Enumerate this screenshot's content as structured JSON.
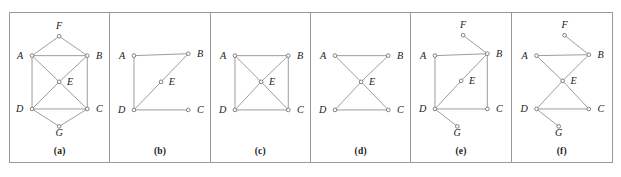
{
  "figure": {
    "title": "",
    "background": "#ffffff",
    "border_color": "#9a9a9a",
    "edge_color": "#8e8e8e",
    "node_stroke": "#6f6f6f",
    "node_fill": "#ffffff",
    "label_color": "#1a1a1a"
  },
  "panels": [
    {
      "caption": "(a)",
      "vertices": [
        {
          "id": "A",
          "label": "A",
          "x": 22,
          "y": 44,
          "lx": 13,
          "ly": 47,
          "anchor": "end"
        },
        {
          "id": "B",
          "label": "B",
          "x": 79,
          "y": 44,
          "lx": 88,
          "ly": 47,
          "anchor": "start"
        },
        {
          "id": "C",
          "label": "C",
          "x": 79,
          "y": 99,
          "lx": 88,
          "ly": 102,
          "anchor": "start"
        },
        {
          "id": "D",
          "label": "D",
          "x": 22,
          "y": 99,
          "lx": 13,
          "ly": 102,
          "anchor": "end"
        },
        {
          "id": "E",
          "label": "E",
          "x": 50,
          "y": 71,
          "lx": 58,
          "ly": 74,
          "anchor": "start"
        },
        {
          "id": "F",
          "label": "F",
          "x": 50,
          "y": 24,
          "lx": 50,
          "ly": 16,
          "anchor": "middle"
        },
        {
          "id": "G",
          "label": "G",
          "x": 50,
          "y": 117,
          "lx": 50,
          "ly": 127,
          "anchor": "middle"
        }
      ],
      "edges": [
        [
          "A",
          "B"
        ],
        [
          "A",
          "D"
        ],
        [
          "A",
          "E"
        ],
        [
          "A",
          "F"
        ],
        [
          "B",
          "C"
        ],
        [
          "B",
          "E"
        ],
        [
          "B",
          "F"
        ],
        [
          "C",
          "D"
        ],
        [
          "C",
          "E"
        ],
        [
          "C",
          "G"
        ],
        [
          "D",
          "E"
        ],
        [
          "D",
          "G"
        ]
      ]
    },
    {
      "caption": "(b)",
      "vertices": [
        {
          "id": "A",
          "label": "A",
          "x": 24,
          "y": 44,
          "lx": 15,
          "ly": 47,
          "anchor": "end"
        },
        {
          "id": "B",
          "label": "B",
          "x": 80,
          "y": 42,
          "lx": 89,
          "ly": 45,
          "anchor": "start"
        },
        {
          "id": "C",
          "label": "C",
          "x": 80,
          "y": 100,
          "lx": 89,
          "ly": 103,
          "anchor": "start"
        },
        {
          "id": "D",
          "label": "D",
          "x": 24,
          "y": 100,
          "lx": 15,
          "ly": 103,
          "anchor": "end"
        },
        {
          "id": "E",
          "label": "E",
          "x": 52,
          "y": 71,
          "lx": 60,
          "ly": 74,
          "anchor": "start"
        }
      ],
      "edges": [
        [
          "A",
          "B"
        ],
        [
          "A",
          "D"
        ],
        [
          "D",
          "C"
        ],
        [
          "D",
          "E"
        ],
        [
          "E",
          "B"
        ]
      ]
    },
    {
      "caption": "(c)",
      "vertices": [
        {
          "id": "A",
          "label": "A",
          "x": 24,
          "y": 44,
          "lx": 15,
          "ly": 47,
          "anchor": "end"
        },
        {
          "id": "B",
          "label": "B",
          "x": 79,
          "y": 44,
          "lx": 88,
          "ly": 47,
          "anchor": "start"
        },
        {
          "id": "C",
          "label": "C",
          "x": 79,
          "y": 100,
          "lx": 88,
          "ly": 103,
          "anchor": "start"
        },
        {
          "id": "D",
          "label": "D",
          "x": 24,
          "y": 100,
          "lx": 15,
          "ly": 103,
          "anchor": "end"
        },
        {
          "id": "E",
          "label": "E",
          "x": 51,
          "y": 71,
          "lx": 59,
          "ly": 74,
          "anchor": "start"
        }
      ],
      "edges": [
        [
          "A",
          "B"
        ],
        [
          "A",
          "D"
        ],
        [
          "D",
          "C"
        ],
        [
          "B",
          "C"
        ],
        [
          "A",
          "E"
        ],
        [
          "B",
          "E"
        ],
        [
          "C",
          "E"
        ],
        [
          "D",
          "E"
        ]
      ]
    },
    {
      "caption": "(d)",
      "vertices": [
        {
          "id": "A",
          "label": "A",
          "x": 24,
          "y": 44,
          "lx": 15,
          "ly": 47,
          "anchor": "end"
        },
        {
          "id": "B",
          "label": "B",
          "x": 79,
          "y": 44,
          "lx": 88,
          "ly": 47,
          "anchor": "start"
        },
        {
          "id": "C",
          "label": "C",
          "x": 79,
          "y": 100,
          "lx": 88,
          "ly": 103,
          "anchor": "start"
        },
        {
          "id": "D",
          "label": "D",
          "x": 24,
          "y": 100,
          "lx": 15,
          "ly": 103,
          "anchor": "end"
        },
        {
          "id": "E",
          "label": "E",
          "x": 51,
          "y": 71,
          "lx": 59,
          "ly": 74,
          "anchor": "start"
        }
      ],
      "edges": [
        [
          "A",
          "B"
        ],
        [
          "D",
          "C"
        ],
        [
          "A",
          "E"
        ],
        [
          "E",
          "C"
        ],
        [
          "B",
          "E"
        ],
        [
          "E",
          "D"
        ]
      ]
    },
    {
      "caption": "(e)",
      "vertices": [
        {
          "id": "A",
          "label": "A",
          "x": 24,
          "y": 44,
          "lx": 15,
          "ly": 47,
          "anchor": "end"
        },
        {
          "id": "B",
          "label": "B",
          "x": 78,
          "y": 42,
          "lx": 87,
          "ly": 45,
          "anchor": "start"
        },
        {
          "id": "C",
          "label": "C",
          "x": 78,
          "y": 99,
          "lx": 87,
          "ly": 102,
          "anchor": "start"
        },
        {
          "id": "D",
          "label": "D",
          "x": 24,
          "y": 99,
          "lx": 15,
          "ly": 102,
          "anchor": "end"
        },
        {
          "id": "E",
          "label": "E",
          "x": 51,
          "y": 70,
          "lx": 59,
          "ly": 73,
          "anchor": "start"
        },
        {
          "id": "F",
          "label": "F",
          "x": 53,
          "y": 23,
          "lx": 53,
          "ly": 15,
          "anchor": "middle"
        },
        {
          "id": "G",
          "label": "G",
          "x": 47,
          "y": 117,
          "lx": 47,
          "ly": 127,
          "anchor": "middle"
        }
      ],
      "edges": [
        [
          "A",
          "B"
        ],
        [
          "A",
          "D"
        ],
        [
          "D",
          "C"
        ],
        [
          "C",
          "B"
        ],
        [
          "D",
          "E"
        ],
        [
          "E",
          "B"
        ],
        [
          "F",
          "B"
        ],
        [
          "D",
          "G"
        ]
      ]
    },
    {
      "caption": "(f)",
      "vertices": [
        {
          "id": "A",
          "label": "A",
          "x": 24,
          "y": 44,
          "lx": 15,
          "ly": 47,
          "anchor": "end"
        },
        {
          "id": "B",
          "label": "B",
          "x": 78,
          "y": 43,
          "lx": 87,
          "ly": 46,
          "anchor": "start"
        },
        {
          "id": "C",
          "label": "C",
          "x": 78,
          "y": 99,
          "lx": 87,
          "ly": 102,
          "anchor": "start"
        },
        {
          "id": "D",
          "label": "D",
          "x": 24,
          "y": 99,
          "lx": 15,
          "ly": 102,
          "anchor": "end"
        },
        {
          "id": "E",
          "label": "E",
          "x": 51,
          "y": 70,
          "lx": 59,
          "ly": 73,
          "anchor": "start"
        },
        {
          "id": "F",
          "label": "F",
          "x": 53,
          "y": 23,
          "lx": 53,
          "ly": 15,
          "anchor": "middle"
        },
        {
          "id": "G",
          "label": "G",
          "x": 47,
          "y": 117,
          "lx": 47,
          "ly": 127,
          "anchor": "middle"
        }
      ],
      "edges": [
        [
          "A",
          "B"
        ],
        [
          "D",
          "C"
        ],
        [
          "A",
          "E"
        ],
        [
          "E",
          "C"
        ],
        [
          "B",
          "E"
        ],
        [
          "E",
          "D"
        ],
        [
          "F",
          "B"
        ],
        [
          "D",
          "G"
        ]
      ]
    }
  ]
}
